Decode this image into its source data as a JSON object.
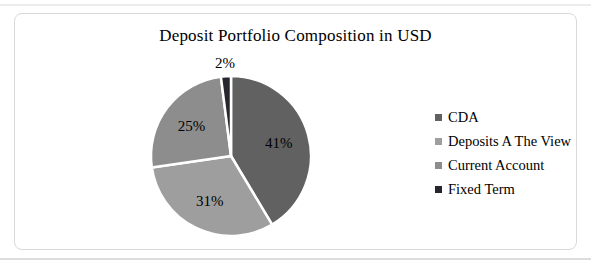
{
  "page": {
    "background": "#ffffff",
    "top_rule_color": "#ececec",
    "bottom_rule_color": "#dcdcdc"
  },
  "chart_frame": {
    "border_color": "#d9d9d9",
    "background": "#ffffff"
  },
  "chart_data": {
    "type": "pie",
    "title": "Deposit Portfolio Composition in USD",
    "categories": [
      "CDA",
      "Deposits A The View",
      "Current Account",
      "Fixed Term"
    ],
    "values": [
      41,
      31,
      25,
      2
    ],
    "labels": [
      "41%",
      "31%",
      "25%",
      "2%"
    ],
    "colors": [
      "#616161",
      "#9e9e9e",
      "#8d8d8d",
      "#26262e"
    ],
    "slice_border_color": "#ffffff",
    "label_color": "#000000",
    "start_angle_deg": 0,
    "direction": "clockwise",
    "legend_position": "right",
    "small_label_outside_threshold": 5
  }
}
